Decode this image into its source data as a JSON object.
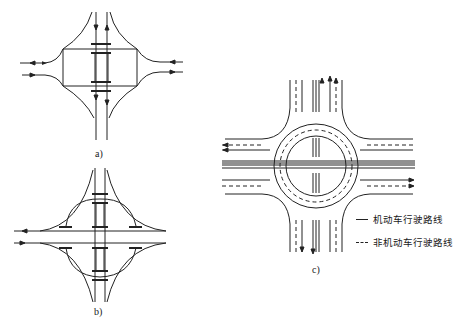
{
  "figure": {
    "panels": [
      {
        "id": "a",
        "label": "a)",
        "description": "Diamond interchange with two bridges"
      },
      {
        "id": "b",
        "label": "b)",
        "description": "Cloverleaf-like interchange with loop ramps"
      },
      {
        "id": "c",
        "label": "c)",
        "description": "Two-level roundabout interchange with motor and non-motor lanes"
      }
    ],
    "legend": {
      "items": [
        {
          "style": "solid",
          "label": "机动车行驶路线"
        },
        {
          "style": "dashed",
          "label": "非机动车行驶路线"
        }
      ]
    },
    "colors": {
      "line": "#222222",
      "background": "#ffffff"
    }
  }
}
